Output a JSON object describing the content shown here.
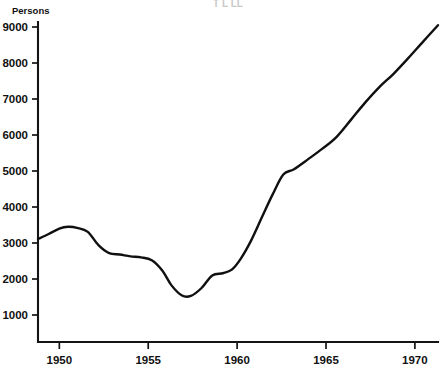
{
  "chart_data": {
    "type": "line",
    "title": "",
    "xlabel": "",
    "ylabel": "Persons",
    "xlim": [
      1948.8,
      1971.3
    ],
    "ylim": [
      0,
      9000
    ],
    "grid": false,
    "legend": false,
    "x_ticks": [
      1950,
      1955,
      1960,
      1965,
      1970
    ],
    "x_tick_labels": [
      "1950",
      "1955",
      "1960",
      "1965",
      "1970"
    ],
    "y_ticks": [
      1000,
      2000,
      3000,
      4000,
      5000,
      6000,
      7000,
      8000,
      9000
    ],
    "y_tick_labels": [
      "1000",
      "2000",
      "3000",
      "4000",
      "5000",
      "6000",
      "7000",
      "8000",
      "9000"
    ],
    "series": [
      {
        "name": "Persons",
        "x": [
          1948.8,
          1949.4,
          1950.0,
          1950.5,
          1951.0,
          1951.6,
          1952.2,
          1952.8,
          1953.4,
          1954.0,
          1954.6,
          1955.2,
          1955.8,
          1956.3,
          1956.9,
          1957.4,
          1958.0,
          1958.6,
          1959.2,
          1959.7,
          1960.2,
          1960.8,
          1961.4,
          1962.0,
          1962.6,
          1963.2,
          1964.0,
          1964.8,
          1965.6,
          1966.4,
          1967.2,
          1968.0,
          1968.8,
          1969.6,
          1970.4,
          1971.3
        ],
        "y": [
          3110,
          3250,
          3400,
          3450,
          3420,
          3310,
          2940,
          2720,
          2680,
          2630,
          2600,
          2520,
          2230,
          1830,
          1540,
          1530,
          1750,
          2100,
          2160,
          2260,
          2560,
          3080,
          3720,
          4350,
          4900,
          5050,
          5330,
          5620,
          5950,
          6420,
          6900,
          7330,
          7700,
          8120,
          8560,
          9050
        ]
      }
    ],
    "notes": {
      "y_axis_label_position": "above-axis-top-left",
      "line_color": "#101010",
      "axis_color": "#141414",
      "background": "#ffffff"
    }
  },
  "header": {
    "clipped_title": "T  L  LL"
  },
  "axis_labels": {
    "y_title": "Persons"
  }
}
